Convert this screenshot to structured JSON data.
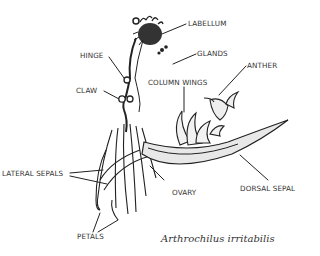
{
  "figure": {
    "caption": "Arthrochilus irritabilis",
    "background": "#ffffff",
    "ink_color": "#222222",
    "labels": {
      "labellum": "LABELLUM",
      "glands": "GLANDS",
      "hinge": "HINGE",
      "anther": "ANTHER",
      "column_wings": "COLUMN WINGS",
      "claw": "CLAW",
      "lateral_sepals": "LATERAL SEPALS",
      "ovary": "OVARY",
      "dorsal_sepal": "DORSAL SEPAL",
      "petals": "PETALS"
    }
  }
}
